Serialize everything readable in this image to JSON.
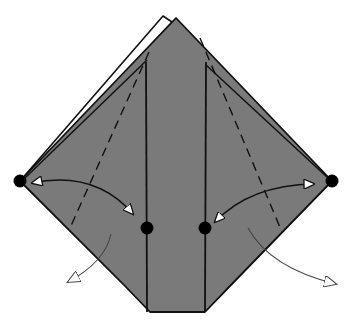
{
  "diagram": {
    "type": "origami-step",
    "colors": {
      "paper_colored": "#7a7a7a",
      "paper_white": "#ffffff",
      "line": "#111111",
      "dot": "#000000",
      "arrow_fill": "#ffffff"
    },
    "points": {
      "left_corner": [
        20,
        181
      ],
      "right_corner": [
        332,
        181
      ],
      "left_center_dot": [
        147,
        228
      ],
      "right_center_dot": [
        205,
        228
      ]
    },
    "annotations": {
      "dots": 4,
      "valley_fold_lines": 2,
      "push_arrows": 2,
      "unfold_arrows": 2
    }
  }
}
